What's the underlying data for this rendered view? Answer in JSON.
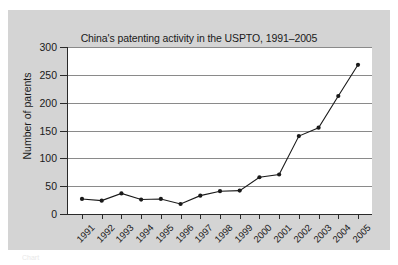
{
  "figure": {
    "background_color": "#d4d4d4",
    "plot_background_color": "#ffffff",
    "axis_color": "#2a2a2a",
    "grid_color": "#8a8a8a",
    "series_color": "#1a1a1a"
  },
  "caption": {
    "text": "Chart"
  },
  "chart_data": {
    "type": "line",
    "title": "China's patenting activity in the USPTO, 1991–2005",
    "xlabel": "",
    "ylabel": "Number of parents",
    "categories": [
      "1991",
      "1992",
      "1993",
      "1994",
      "1995",
      "1996",
      "1997",
      "1998",
      "1999",
      "2000",
      "2001",
      "2002",
      "2003",
      "2004",
      "2005"
    ],
    "values": [
      27,
      24,
      37,
      26,
      27,
      18,
      33,
      41,
      42,
      66,
      71,
      140,
      155,
      212,
      268
    ],
    "ylim": [
      0,
      300
    ],
    "yticks": [
      0,
      50,
      100,
      150,
      200,
      250,
      300
    ],
    "ytick_labels": [
      "0",
      "50",
      "100",
      "150",
      "200",
      "250",
      "300"
    ],
    "grid": "horizontal",
    "legend": "none",
    "marker": "filled-circle",
    "xtick_label_rotation": -45
  }
}
